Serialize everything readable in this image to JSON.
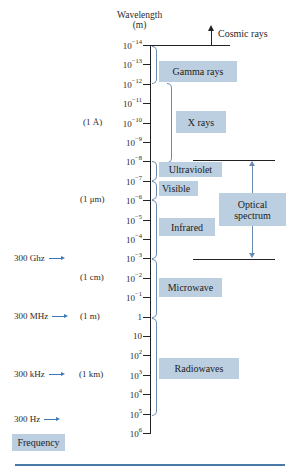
{
  "axis": {
    "title_line1": "Wavelength",
    "title_line2": "(m)",
    "ticks": [
      {
        "base": "10",
        "exp": "−14"
      },
      {
        "base": "10",
        "exp": "−13"
      },
      {
        "base": "10",
        "exp": "−12"
      },
      {
        "base": "10",
        "exp": "−11"
      },
      {
        "base": "10",
        "exp": "−10"
      },
      {
        "base": "10",
        "exp": "−9"
      },
      {
        "base": "10",
        "exp": "−8"
      },
      {
        "base": "10",
        "exp": "−7"
      },
      {
        "base": "10",
        "exp": "−6"
      },
      {
        "base": "10",
        "exp": "−5"
      },
      {
        "base": "10",
        "exp": "−4"
      },
      {
        "base": "10",
        "exp": "−3"
      },
      {
        "base": "10",
        "exp": "−2"
      },
      {
        "base": "10",
        "exp": "−1"
      },
      {
        "base": "1",
        "exp": ""
      },
      {
        "base": "10",
        "exp": ""
      },
      {
        "base": "10",
        "exp": "2"
      },
      {
        "base": "10",
        "exp": "3"
      },
      {
        "base": "10",
        "exp": "4"
      },
      {
        "base": "10",
        "exp": "5"
      },
      {
        "base": "10",
        "exp": "6"
      }
    ]
  },
  "wavelength_markers": {
    "angstrom": "(1 Å)",
    "micrometer": "(1 μm)",
    "centimeter": "(1 cm)",
    "meter": "(1 m)",
    "kilometer": "(1 km)"
  },
  "frequency_markers": {
    "ghz": "300 Ghz",
    "mhz": "300 MHz",
    "khz": "300 kHz",
    "hz": "300 Hz",
    "label": "Frequency"
  },
  "bands": {
    "cosmic": "Cosmic rays",
    "gamma": "Gamma rays",
    "xray": "X rays",
    "uv": "Ultraviolet",
    "visible": "Visible",
    "infrared": "Infrared",
    "optical_line1": "Optical",
    "optical_line2": "spectrum",
    "microwave": "Microwave",
    "radio": "Radiowaves"
  },
  "colors": {
    "box_fill": "#bccfe0",
    "brace": "#6a8bb0",
    "rule": "#4a78a8"
  }
}
